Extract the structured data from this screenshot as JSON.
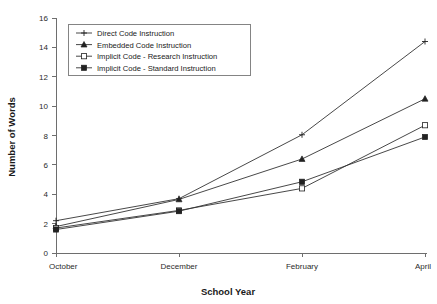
{
  "chart_data": {
    "type": "line",
    "title": "",
    "xlabel": "School Year",
    "ylabel": "Number of Words",
    "categories": [
      "October",
      "December",
      "February",
      "April"
    ],
    "xtick_labels": [
      "October",
      "December",
      "February",
      "April"
    ],
    "ytick_labels": [
      "0",
      "2",
      "4",
      "6",
      "8",
      "10",
      "12",
      "14",
      "16"
    ],
    "yticks": [
      0,
      2,
      4,
      6,
      8,
      10,
      12,
      14,
      16
    ],
    "ylim": [
      0,
      16
    ],
    "grid": false,
    "legend_position": "upper-left-inside",
    "series": [
      {
        "name": "Direct Code Instruction",
        "marker": "cross",
        "values": [
          2.2,
          3.7,
          8.05,
          14.4
        ]
      },
      {
        "name": "Embedded Code Instruction",
        "marker": "triangle",
        "values": [
          1.8,
          3.65,
          6.4,
          10.5
        ]
      },
      {
        "name": "Implicit Code - Research Instruction",
        "marker": "open-square",
        "values": [
          1.7,
          2.9,
          4.4,
          8.7
        ]
      },
      {
        "name": "Implicit Code - Standard Instruction",
        "marker": "filled-square",
        "values": [
          1.6,
          2.85,
          4.85,
          7.9
        ]
      }
    ]
  },
  "legend": {
    "entries": [
      "Direct Code Instruction",
      "Embedded Code Instruction",
      "Implicit Code - Research Instruction",
      "Implicit Code - Standard Instruction"
    ]
  },
  "axis": {
    "x_title": "School Year",
    "y_title": "Number of Words"
  },
  "colors": {
    "line": "#333333",
    "axis": "#6e6e6e",
    "text": "#1a1a1a",
    "background": "#ffffff"
  }
}
